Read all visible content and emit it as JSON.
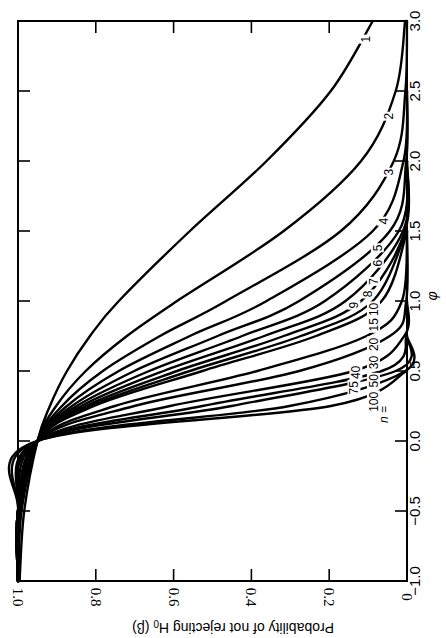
{
  "chart_data": {
    "type": "line",
    "title": "",
    "orientation_note_rotated_90_clockwise": true,
    "xlabel": "φ",
    "ylabel": "Probability of not rejecting H0 (β)",
    "xlim": [
      -1.0,
      3.0
    ],
    "ylim": [
      0,
      1.0
    ],
    "x_ticks": [
      "-1.0",
      "-0.5",
      "0.0",
      "0.5",
      "1.0",
      "1.5",
      "2.0",
      "2.5",
      "3.0"
    ],
    "y_ticks": [
      "0",
      "0.2",
      "0.4",
      "0.6",
      "0.8",
      "1.0"
    ],
    "grid": false,
    "legend": "inline curve labels (n values)",
    "n_prefix_label": "n =",
    "x": [
      -1.0,
      -0.5,
      0.0,
      0.25,
      0.5,
      0.75,
      1.0,
      1.5,
      2.0,
      2.5,
      3.0
    ],
    "series": [
      {
        "name": "1",
        "values": [
          0.996,
          0.984,
          0.95,
          0.918,
          0.874,
          0.815,
          0.741,
          0.558,
          0.361,
          0.196,
          0.088
        ]
      },
      {
        "name": "2",
        "values": [
          0.999,
          0.991,
          0.95,
          0.902,
          0.826,
          0.72,
          0.591,
          0.317,
          0.118,
          0.029,
          0.005
        ]
      },
      {
        "name": "3",
        "values": [
          1.0,
          0.994,
          0.95,
          0.887,
          0.782,
          0.635,
          0.465,
          0.17,
          0.034,
          0.004,
          0.0
        ]
      },
      {
        "name": "4",
        "values": [
          1.0,
          0.996,
          0.95,
          0.874,
          0.741,
          0.558,
          0.361,
          0.088,
          0.009,
          0.0,
          0.0
        ]
      },
      {
        "name": "5",
        "values": [
          1.0,
          0.997,
          0.95,
          0.861,
          0.701,
          0.487,
          0.277,
          0.044,
          0.002,
          0.0,
          0.0
        ]
      },
      {
        "name": "6",
        "values": [
          1.0,
          0.998,
          0.95,
          0.849,
          0.663,
          0.424,
          0.211,
          0.021,
          0.0,
          0.0,
          0.0
        ]
      },
      {
        "name": "7",
        "values": [
          1.0,
          0.998,
          0.95,
          0.837,
          0.626,
          0.367,
          0.158,
          0.01,
          0.0,
          0.0,
          0.0
        ]
      },
      {
        "name": "8",
        "values": [
          1.0,
          0.999,
          0.95,
          0.826,
          0.591,
          0.317,
          0.118,
          0.005,
          0.0,
          0.0,
          0.0
        ]
      },
      {
        "name": "9",
        "values": [
          1.0,
          0.999,
          0.95,
          0.815,
          0.558,
          0.273,
          0.088,
          0.001,
          0.0,
          0.0,
          0.0
        ]
      },
      {
        "name": "10",
        "values": [
          1.0,
          0.999,
          0.95,
          0.804,
          0.526,
          0.234,
          0.065,
          0.0,
          0.0,
          0.0,
          0.0
        ]
      },
      {
        "name": "15",
        "values": [
          1.0,
          1.0,
          0.95,
          0.751,
          0.385,
          0.104,
          0.013,
          0.0,
          0.0,
          0.0,
          0.0
        ]
      },
      {
        "name": "20",
        "values": [
          1.0,
          1.0,
          0.95,
          0.701,
          0.277,
          0.044,
          0.002,
          0.0,
          0.0,
          0.0,
          0.0
        ]
      },
      {
        "name": "30",
        "values": [
          1.0,
          1.0,
          0.95,
          0.609,
          0.137,
          0.007,
          0.0,
          0.0,
          0.0,
          0.0,
          0.0
        ]
      },
      {
        "name": "40",
        "values": [
          1.0,
          1.0,
          0.95,
          0.526,
          0.065,
          0.001,
          0.0,
          0.0,
          0.0,
          0.0,
          0.0
        ]
      },
      {
        "name": "50",
        "values": [
          1.0,
          1.0,
          0.95,
          0.451,
          0.029,
          0.0,
          0.0,
          0.0,
          0.0,
          0.0,
          0.0
        ]
      },
      {
        "name": "75",
        "values": [
          1.0,
          1.0,
          0.95,
          0.302,
          0.004,
          0.0,
          0.0,
          0.0,
          0.0,
          0.0,
          0.0
        ]
      },
      {
        "name": "100",
        "values": [
          1.0,
          1.0,
          0.95,
          0.196,
          0.0,
          0.0,
          0.0,
          0.0,
          0.0,
          0.0,
          0.0
        ]
      }
    ],
    "curve_label_positions": [
      {
        "name": "1",
        "phi": 2.87,
        "beta": 0.105
      },
      {
        "name": "2",
        "phi": 2.32,
        "beta": 0.045
      },
      {
        "name": "3",
        "phi": 1.92,
        "beta": 0.045
      },
      {
        "name": "4",
        "phi": 1.57,
        "beta": 0.06
      },
      {
        "name": "5",
        "phi": 1.38,
        "beta": 0.075
      },
      {
        "name": "6",
        "phi": 1.27,
        "beta": 0.075
      },
      {
        "name": "7",
        "phi": 1.14,
        "beta": 0.085
      },
      {
        "name": "8",
        "phi": 1.05,
        "beta": 0.1
      },
      {
        "name": "9",
        "phi": 0.97,
        "beta": 0.135
      },
      {
        "name": "10",
        "phi": 0.94,
        "beta": 0.085
      },
      {
        "name": "15",
        "phi": 0.83,
        "beta": 0.085
      },
      {
        "name": "20",
        "phi": 0.69,
        "beta": 0.085
      },
      {
        "name": "30",
        "phi": 0.56,
        "beta": 0.085
      },
      {
        "name": "40",
        "phi": 0.49,
        "beta": 0.13
      },
      {
        "name": "50",
        "phi": 0.43,
        "beta": 0.085
      },
      {
        "name": "75",
        "phi": 0.38,
        "beta": 0.135
      },
      {
        "name": "100",
        "phi": 0.28,
        "beta": 0.085
      }
    ]
  },
  "axes": {
    "beta_axis_title": "Probability of not rejecting H",
    "beta_axis_title_sub": "0",
    "beta_axis_title_suffix": " (β)",
    "phi_axis_title": "φ",
    "n_label": "n ="
  }
}
